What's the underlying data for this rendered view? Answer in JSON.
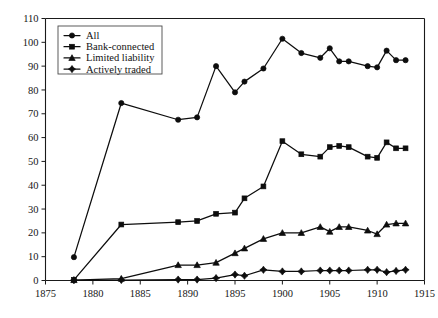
{
  "chart_data": {
    "type": "line",
    "title": "",
    "subtitle": "",
    "xlabel": "",
    "ylabel": "",
    "xlim": [
      1875,
      1915
    ],
    "ylim": [
      0,
      110
    ],
    "xticks": [
      1875,
      1880,
      1885,
      1890,
      1895,
      1900,
      1905,
      1910,
      1915
    ],
    "yticks": [
      0,
      10,
      20,
      30,
      40,
      50,
      60,
      70,
      80,
      90,
      100,
      110
    ],
    "grid": false,
    "legend_position": "top-left",
    "series": [
      {
        "name": "All",
        "marker": "circle",
        "x": [
          1878,
          1883,
          1889,
          1891,
          1893,
          1895,
          1896,
          1898,
          1900,
          1902,
          1904,
          1905,
          1906,
          1907,
          1909,
          1910,
          1911,
          1912,
          1913
        ],
        "values": [
          9.8,
          74.5,
          67.5,
          68.5,
          90.0,
          79.0,
          83.5,
          89.0,
          101.5,
          95.5,
          93.5,
          97.5,
          92.0,
          92.0,
          90.0,
          89.5,
          96.5,
          92.5,
          92.5
        ]
      },
      {
        "name": "Bank-connected",
        "marker": "square",
        "x": [
          1878,
          1883,
          1889,
          1891,
          1893,
          1895,
          1896,
          1898,
          1900,
          1902,
          1904,
          1905,
          1906,
          1907,
          1909,
          1910,
          1911,
          1912,
          1913
        ],
        "values": [
          0.3,
          23.5,
          24.5,
          25.0,
          28.0,
          28.5,
          34.5,
          39.5,
          58.5,
          53.0,
          52.0,
          56.0,
          56.5,
          56.0,
          52.0,
          51.5,
          58.0,
          55.5,
          55.5
        ]
      },
      {
        "name": "Limited liability",
        "marker": "triangle",
        "x": [
          1878,
          1883,
          1889,
          1891,
          1893,
          1895,
          1896,
          1898,
          1900,
          1902,
          1904,
          1905,
          1906,
          1907,
          1909,
          1910,
          1911,
          1912,
          1913
        ],
        "values": [
          0.2,
          0.8,
          6.5,
          6.5,
          7.5,
          11.5,
          13.5,
          17.5,
          20.0,
          20.0,
          22.5,
          20.5,
          22.5,
          22.5,
          21.0,
          19.5,
          23.5,
          24.0,
          24.0
        ]
      },
      {
        "name": "Actively traded",
        "marker": "diamond",
        "x": [
          1878,
          1883,
          1889,
          1891,
          1893,
          1895,
          1896,
          1898,
          1900,
          1902,
          1904,
          1905,
          1906,
          1907,
          1909,
          1910,
          1911,
          1912,
          1913
        ],
        "values": [
          0.1,
          0.2,
          0.4,
          0.4,
          1.0,
          2.5,
          2.0,
          4.5,
          3.8,
          3.8,
          4.2,
          4.2,
          4.2,
          4.2,
          4.5,
          4.5,
          3.5,
          4.0,
          4.5
        ]
      }
    ]
  },
  "legend": {
    "items": [
      {
        "label": "All",
        "marker": "circle"
      },
      {
        "label": "Bank-connected",
        "marker": "square"
      },
      {
        "label": "Limited liability",
        "marker": "triangle"
      },
      {
        "label": "Actively traded",
        "marker": "diamond"
      }
    ]
  },
  "colors": {
    "ink": "#0d0d0d",
    "axis": "#1a1a1a",
    "background": "#ffffff"
  }
}
